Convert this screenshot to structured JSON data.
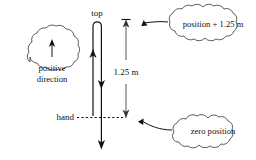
{
  "diagram": {
    "title_alt": "projectile-up-and-down-position-diagram",
    "background": "#ffffff",
    "ink_color": "#111111",
    "dimension_color": "#555555",
    "labels": {
      "top": "top",
      "hand": "hand",
      "distance": "1.25 m"
    },
    "callouts": [
      {
        "id": "positive-direction",
        "text_line1": "positive",
        "text_line2": "direction",
        "has_internal_arrow": true,
        "arrow_direction": "up"
      },
      {
        "id": "position-plus",
        "text_line1": "position + 1.25 m",
        "text_line2": "",
        "has_internal_arrow": false,
        "arrow_direction": ""
      },
      {
        "id": "zero-position",
        "text_line1": "zero position",
        "text_line2": "",
        "has_internal_arrow": false,
        "arrow_direction": ""
      }
    ],
    "trajectory": {
      "up_arrow_label": "upward path",
      "down_arrow_label": "downward path",
      "turnaround_label": "top"
    }
  }
}
